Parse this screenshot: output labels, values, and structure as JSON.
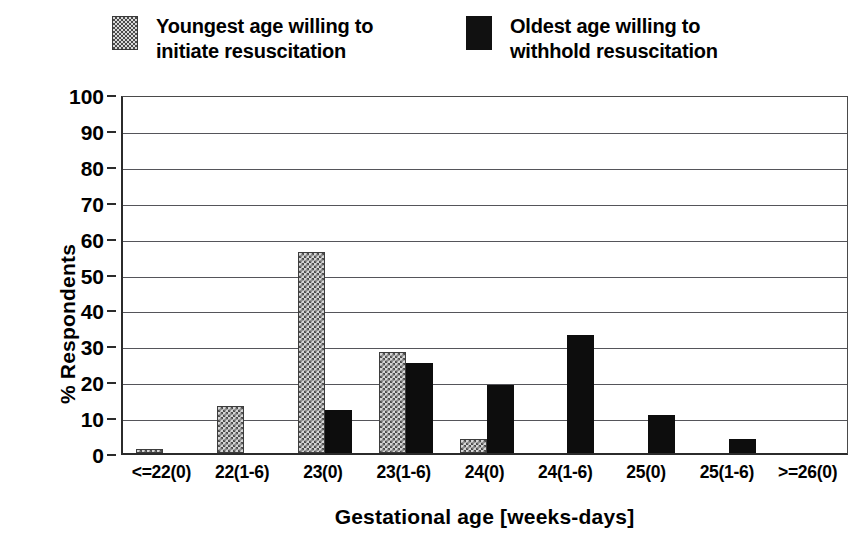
{
  "chart_data": {
    "type": "bar",
    "title": "",
    "xlabel": "Gestational age [weeks-days]",
    "ylabel": "% Respondents",
    "ylim": [
      0,
      100
    ],
    "ytick_step": 10,
    "yticks": [
      100,
      90,
      80,
      70,
      60,
      50,
      40,
      30,
      20,
      10,
      0
    ],
    "grid": "horizontal",
    "legend_position": "top",
    "categories": [
      "<=22(0)",
      "22(1-6)",
      "23(0)",
      "23(1-6)",
      "24(0)",
      "24(1-6)",
      "25(0)",
      "25(1-6)",
      ">=26(0)"
    ],
    "series": [
      {
        "name": "Youngest age willing to initiate resuscitation",
        "fill": "checkerboard",
        "color": "#d6d6d6",
        "values": [
          1,
          13,
          56,
          28,
          4,
          0,
          0,
          0,
          0
        ]
      },
      {
        "name": "Oldest age willing to withhold resuscitation",
        "fill": "solid",
        "color": "#0d0d0d",
        "values": [
          0,
          0,
          12,
          25,
          19,
          33,
          10.5,
          4,
          0
        ]
      }
    ]
  },
  "legend": {
    "entries": [
      {
        "label": "Youngest age willing to\ninitiate resuscitation",
        "swatch": "checkerboard-swatch"
      },
      {
        "label": "Oldest age willing to\nwithhold resuscitation",
        "swatch": "black-swatch"
      }
    ]
  },
  "axes": {
    "y_title": "% Respondents",
    "x_title": "Gestational age [weeks-days]"
  }
}
